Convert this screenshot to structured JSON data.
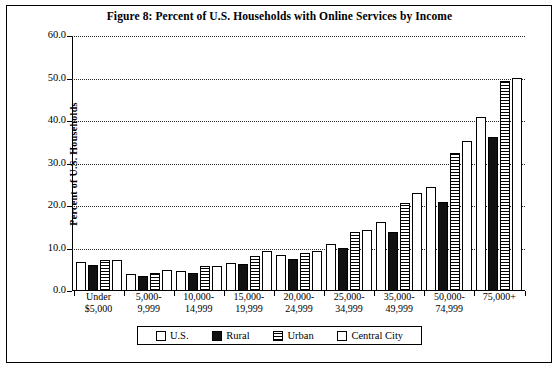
{
  "figure": {
    "title": "Figure 8: Percent of U.S. Households with Online Services by Income"
  },
  "legend": {
    "items": [
      {
        "label": "U.S.",
        "key": "us"
      },
      {
        "label": "Rural",
        "key": "rural"
      },
      {
        "label": "Urban",
        "key": "urban"
      },
      {
        "label": "Central City",
        "key": "cc"
      }
    ]
  },
  "chart_data": {
    "type": "bar",
    "title": "Figure 8: Percent of U.S. Households with Online Services by Income",
    "xlabel": "",
    "ylabel": "Percent of U.S. Households",
    "ylim": [
      0,
      60
    ],
    "yticks": [
      "0.0",
      "10.0",
      "20.0",
      "30.0",
      "40.0",
      "50.0",
      "60.0"
    ],
    "grid": true,
    "legend_position": "bottom",
    "categories": [
      [
        "Under",
        "$5,000"
      ],
      [
        "5,000-",
        "9,999"
      ],
      [
        "10,000-",
        "14,999"
      ],
      [
        "15,000-",
        "19,999"
      ],
      [
        "20,000-",
        "24,999"
      ],
      [
        "25,000-",
        "34,999"
      ],
      [
        "35,000-",
        "49,999"
      ],
      [
        "50,000-",
        "74,999"
      ],
      [
        "75,000+"
      ]
    ],
    "series": [
      {
        "name": "U.S.",
        "key": "us",
        "values": [
          6.8,
          3.9,
          4.6,
          6.6,
          8.4,
          11.0,
          16.3,
          24.4,
          41.0
        ]
      },
      {
        "name": "Rural",
        "key": "rural",
        "values": [
          6.1,
          3.6,
          4.2,
          6.3,
          7.6,
          10.1,
          14.0,
          21.0,
          36.2
        ]
      },
      {
        "name": "Urban",
        "key": "urban",
        "values": [
          7.2,
          4.3,
          5.8,
          8.3,
          9.0,
          13.9,
          20.6,
          32.5,
          49.4
        ]
      },
      {
        "name": "Central City",
        "key": "cc",
        "values": [
          7.4,
          4.9,
          6.0,
          9.5,
          9.5,
          14.3,
          23.0,
          35.3,
          50.1
        ]
      }
    ]
  }
}
